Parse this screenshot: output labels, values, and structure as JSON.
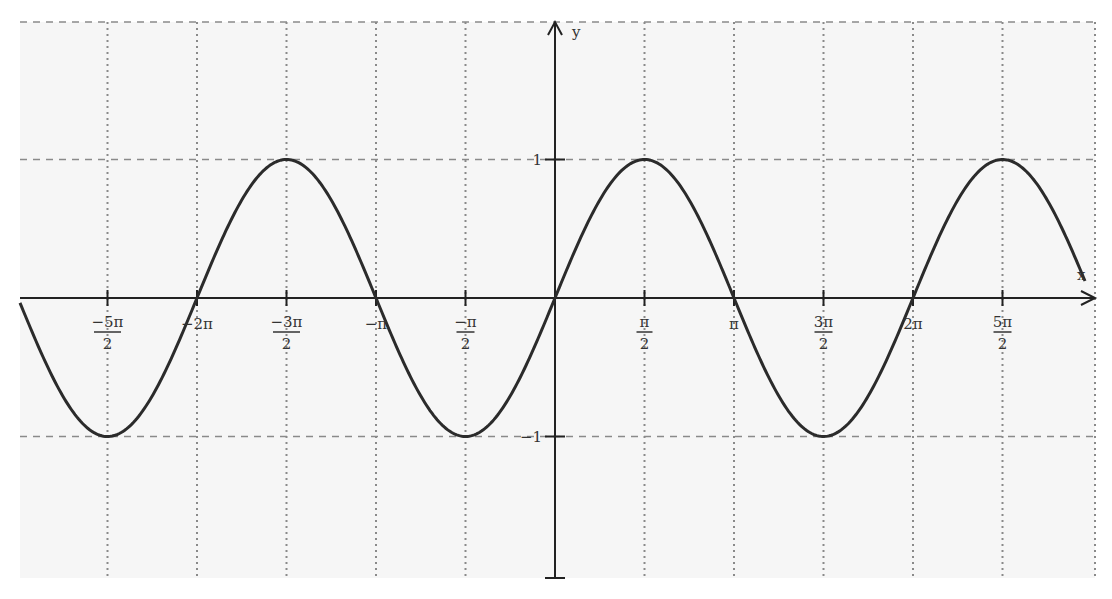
{
  "chart_data": {
    "type": "line",
    "title": "",
    "function": "y = sin(x)",
    "xlabel": "x",
    "ylabel": "y",
    "xlim": [
      -8.1,
      9.3
    ],
    "ylim": [
      -2.0,
      2.0
    ],
    "grid": true,
    "legend": null,
    "x_ticks": [
      {
        "value": -7.853981634,
        "label_num": "−5π",
        "label_den": "2"
      },
      {
        "value": -6.283185307,
        "label": "−2π"
      },
      {
        "value": -4.71238898,
        "label_num": "−3π",
        "label_den": "2"
      },
      {
        "value": -3.141592654,
        "label": "−π"
      },
      {
        "value": -1.570796327,
        "label_num": "−π",
        "label_den": "2"
      },
      {
        "value": 1.570796327,
        "label_num": "π",
        "label_den": "2"
      },
      {
        "value": 3.141592654,
        "label": "π"
      },
      {
        "value": 4.71238898,
        "label_num": "3π",
        "label_den": "2"
      },
      {
        "value": 6.283185307,
        "label": "2π"
      },
      {
        "value": 7.853981634,
        "label_num": "5π",
        "label_den": "2"
      }
    ],
    "y_ticks": [
      {
        "value": 1,
        "label": "1"
      },
      {
        "value": -1,
        "label": "−1"
      }
    ],
    "series": [
      {
        "name": "sin(x)",
        "color": "#2b2b2b",
        "key_points": [
          {
            "x": "-5π/2",
            "y": -1
          },
          {
            "x": "-2π",
            "y": 0
          },
          {
            "x": "-3π/2",
            "y": 1
          },
          {
            "x": "-π",
            "y": 0
          },
          {
            "x": "-π/2",
            "y": -1
          },
          {
            "x": "0",
            "y": 0
          },
          {
            "x": "π/2",
            "y": 1
          },
          {
            "x": "π",
            "y": 0
          },
          {
            "x": "3π/2",
            "y": -1
          },
          {
            "x": "2π",
            "y": 0
          },
          {
            "x": "5π/2",
            "y": 1
          }
        ]
      }
    ]
  },
  "colors": {
    "background": "#f6f6f6",
    "axis": "#222222",
    "grid": "#8a8a8a",
    "curve": "#2b2b2b"
  }
}
